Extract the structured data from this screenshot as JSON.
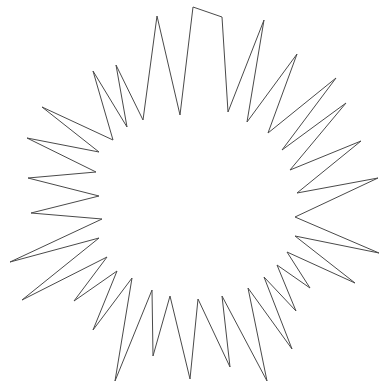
{
  "figure": {
    "shape_type": "star-polygon",
    "canvas": {
      "width": 387,
      "height": 387,
      "background_color": "#ffffff"
    },
    "stroke": {
      "color": "#4a4a4a",
      "width": 1,
      "fill": "none",
      "linejoin": "miter"
    },
    "geometry": {
      "center": [
        193,
        195
      ],
      "point_count": 24,
      "outer_radius_range": [
        150,
        190
      ],
      "inner_radius_range": [
        95,
        125
      ],
      "bounding_box": [
        8,
        7,
        379,
        381
      ]
    },
    "vertices": [
      [
        193,
        7
      ],
      [
        180,
        115
      ],
      [
        157,
        16
      ],
      [
        143,
        120
      ],
      [
        116,
        65
      ],
      [
        127,
        127
      ],
      [
        93,
        71
      ],
      [
        113,
        140
      ],
      [
        42,
        107
      ],
      [
        99,
        152
      ],
      [
        27,
        138
      ],
      [
        96,
        172
      ],
      [
        28,
        178
      ],
      [
        99,
        196
      ],
      [
        31,
        213
      ],
      [
        102,
        219
      ],
      [
        10,
        262
      ],
      [
        99,
        238
      ],
      [
        22,
        300
      ],
      [
        107,
        257
      ],
      [
        74,
        301
      ],
      [
        117,
        271
      ],
      [
        93,
        330
      ],
      [
        132,
        278
      ],
      [
        115,
        381
      ],
      [
        152,
        290
      ],
      [
        153,
        356
      ],
      [
        170,
        296
      ],
      [
        190,
        379
      ],
      [
        198,
        299
      ],
      [
        230,
        367
      ],
      [
        222,
        296
      ],
      [
        267,
        381
      ],
      [
        248,
        288
      ],
      [
        292,
        349
      ],
      [
        264,
        277
      ],
      [
        296,
        311
      ],
      [
        277,
        265
      ],
      [
        310,
        288
      ],
      [
        287,
        252
      ],
      [
        355,
        283
      ],
      [
        295,
        236
      ],
      [
        379,
        253
      ],
      [
        295,
        217
      ],
      [
        378,
        178
      ],
      [
        297,
        193
      ],
      [
        361,
        141
      ],
      [
        290,
        170
      ],
      [
        346,
        103
      ],
      [
        282,
        150
      ],
      [
        336,
        78
      ],
      [
        268,
        133
      ],
      [
        297,
        54
      ],
      [
        247,
        122
      ],
      [
        264,
        20
      ],
      [
        228,
        112
      ],
      [
        222,
        17
      ]
    ]
  }
}
